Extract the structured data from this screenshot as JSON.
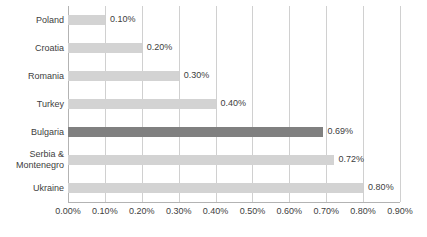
{
  "chart_data": {
    "type": "bar",
    "orientation": "horizontal",
    "title": "",
    "subtitle": "",
    "xlabel": "",
    "ylabel": "",
    "categories": [
      "Poland",
      "Croatia",
      "Romania",
      "Turkey",
      "Bulgaria",
      "Serbia &\nMontenegro",
      "Ukraine"
    ],
    "values": [
      0.1,
      0.2,
      0.3,
      0.4,
      0.69,
      0.72,
      0.8
    ],
    "value_labels": [
      "0.10%",
      "0.20%",
      "0.30%",
      "0.40%",
      "0.69%",
      "0.72%",
      "0.80%"
    ],
    "highlighted_category": "Bulgaria",
    "xlim": [
      0.0,
      0.9
    ],
    "xticks": [
      0.0,
      0.1,
      0.2,
      0.3,
      0.4,
      0.5,
      0.6,
      0.7,
      0.8,
      0.9
    ],
    "xtick_labels": [
      "0.00%",
      "0.10%",
      "0.20%",
      "0.30%",
      "0.40%",
      "0.50%",
      "0.60%",
      "0.70%",
      "0.80%",
      "0.90%"
    ],
    "grid": true,
    "legend": false,
    "unit": "%"
  },
  "colors": {
    "bar": "#d3d3d3",
    "bar_highlight": "#808080",
    "gridline": "#d0d0d0",
    "axis": "#b3b3b3",
    "text": "#404040",
    "background": "#ffffff"
  }
}
